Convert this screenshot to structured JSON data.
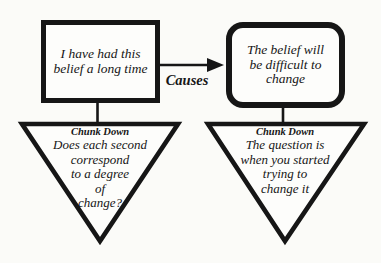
{
  "colors": {
    "ink": "#161616",
    "background": "#fbfbf8",
    "shape_fill": "#fdfdfb"
  },
  "boxes": {
    "left": {
      "lines": [
        "I have had this",
        "belief a long time"
      ]
    },
    "right": {
      "lines": [
        "The belief will",
        "be difficult to",
        "change"
      ]
    }
  },
  "arrow": {
    "label": "Causes"
  },
  "triangles": {
    "left": {
      "heading": "Chunk Down",
      "lines": [
        "Does each second",
        "correspond",
        "to a degree",
        "of",
        "change?"
      ]
    },
    "right": {
      "heading": "Chunk Down",
      "lines": [
        "The question is",
        "when you started",
        "trying to",
        "change it"
      ]
    }
  }
}
